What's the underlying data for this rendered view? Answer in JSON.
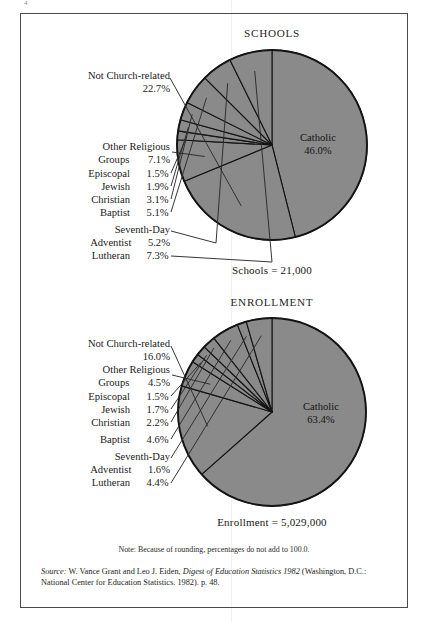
{
  "page": {
    "folio": "4",
    "background": "#ffffff",
    "frame_color": "#4a4a4a"
  },
  "colors": {
    "pie_fill": "#8a8a8a",
    "pie_stroke": "#141414",
    "text": "#1b1b1b",
    "leader": "#2b2b2b"
  },
  "charts": [
    {
      "id": "schools",
      "title": "SCHOOLS",
      "total_label": "Schools  =  21,000",
      "inside_label": {
        "name": "Catholic",
        "percent": "46.0%"
      },
      "labels": [
        {
          "name": "Not Church-related",
          "percent": "22.7%"
        },
        {
          "name": "Other Religious",
          "name2": "Groups",
          "percent": "7.1%"
        },
        {
          "name": "Episcopal",
          "percent": "1.5%"
        },
        {
          "name": "Jewish",
          "percent": "1.9%"
        },
        {
          "name": "Christian",
          "percent": "3.1%"
        },
        {
          "name": "Baptist",
          "percent": "5.1%"
        },
        {
          "name": "Seventh-Day",
          "name2": "Adventist",
          "percent": "5.2%"
        },
        {
          "name": "Lutheran",
          "percent": "7.3%"
        }
      ]
    },
    {
      "id": "enrollment",
      "title": "ENROLLMENT",
      "total_label": "Enrollment  =  5,029,000",
      "inside_label": {
        "name": "Catholic",
        "percent": "63.4%"
      },
      "labels": [
        {
          "name": "Not Church-related",
          "percent": "16.0%"
        },
        {
          "name": "Other Religious",
          "name2": "Groups",
          "percent": "4.5%"
        },
        {
          "name": "Episcopal",
          "percent": "1.5%"
        },
        {
          "name": "Jewish",
          "percent": "1.7%"
        },
        {
          "name": "Christian",
          "percent": "2.2%"
        },
        {
          "name": "Baptist",
          "percent": "4.6%"
        },
        {
          "name": "Seventh-Day",
          "name2": "Adventist",
          "percent": "1.6%"
        },
        {
          "name": "Lutheran",
          "percent": "4.4%"
        }
      ]
    }
  ],
  "note": "Note: Because of rounding, percentages do not add to 100.0.",
  "source": {
    "word": "Source:",
    "text_a": " W. Vance Grant and Leo J. Eiden, ",
    "title": "Digest of Education Statistics 1982",
    "text_b": " (Washington, D.C.: National Center for Education Statistics. 1982). p. 48."
  },
  "chart_data": [
    {
      "type": "pie",
      "title": "SCHOOLS",
      "subtitle": "Schools = 21,000",
      "total": 21000,
      "categories": [
        "Catholic",
        "Not Church-related",
        "Other Religious Groups",
        "Episcopal",
        "Jewish",
        "Christian",
        "Baptist",
        "Seventh-Day Adventist",
        "Lutheran"
      ],
      "values": [
        46.0,
        22.7,
        7.1,
        1.5,
        1.9,
        3.1,
        5.1,
        5.2,
        7.3
      ],
      "unit": "percent",
      "start_angle_deg": 0,
      "direction": "clockwise",
      "slice_color": "#8a8a8a",
      "legend": "callout-labels",
      "grid": false
    },
    {
      "type": "pie",
      "title": "ENROLLMENT",
      "subtitle": "Enrollment = 5,029,000",
      "total": 5029000,
      "categories": [
        "Catholic",
        "Not Church-related",
        "Other Religious Groups",
        "Episcopal",
        "Jewish",
        "Christian",
        "Baptist",
        "Seventh-Day Adventist",
        "Lutheran"
      ],
      "values": [
        63.4,
        16.0,
        4.5,
        1.5,
        1.7,
        2.2,
        4.6,
        1.6,
        4.4
      ],
      "unit": "percent",
      "start_angle_deg": 0,
      "direction": "clockwise",
      "slice_color": "#8a8a8a",
      "legend": "callout-labels",
      "grid": false
    }
  ]
}
